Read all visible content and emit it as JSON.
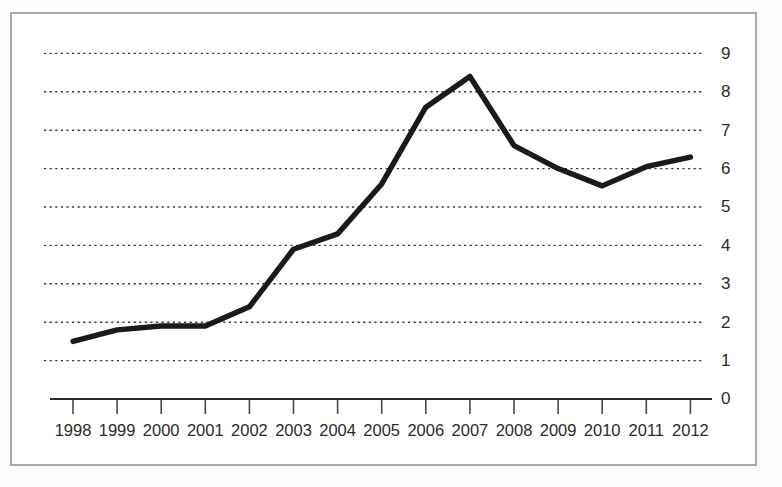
{
  "figure": {
    "frame_border_color": "#a9a9a9",
    "background_color": "#ffffff",
    "line_color": "#1a1a1a",
    "gridline_color": "#3a3a3a",
    "axis_color": "#2a2a2a",
    "tick_label_color": "#2b2b2b"
  },
  "chart_data": {
    "type": "line",
    "title": "",
    "subtitle": "",
    "xlabel": "",
    "ylabel": "",
    "categories": [
      "1998",
      "1999",
      "2000",
      "2001",
      "2002",
      "2003",
      "2004",
      "2005",
      "2006",
      "2007",
      "2008",
      "2009",
      "2010",
      "2011",
      "2012"
    ],
    "values": [
      1.5,
      1.8,
      1.9,
      1.9,
      2.4,
      3.9,
      4.3,
      5.6,
      7.6,
      8.4,
      6.6,
      6.0,
      5.55,
      6.05,
      6.3
    ],
    "series": [
      {
        "name": "",
        "values": [
          1.5,
          1.8,
          1.9,
          1.9,
          2.4,
          3.9,
          4.3,
          5.6,
          7.6,
          8.4,
          6.6,
          6.0,
          5.55,
          6.05,
          6.3
        ]
      }
    ],
    "ylim": [
      0,
      9
    ],
    "xlim": [
      "1998",
      "2012"
    ],
    "ytick_labels": [
      "0",
      "1",
      "2",
      "3",
      "4",
      "5",
      "6",
      "7",
      "8",
      "9"
    ],
    "ytick_values": [
      0,
      1,
      2,
      3,
      4,
      5,
      6,
      7,
      8,
      9
    ],
    "xtick_labels": [
      "1998",
      "1999",
      "2000",
      "2001",
      "2002",
      "2003",
      "2004",
      "2005",
      "2006",
      "2007",
      "2008",
      "2009",
      "2010",
      "2011",
      "2012"
    ],
    "grid": true,
    "grid_style": "dotted-horizontal",
    "y_axis_position": "right",
    "legend": false,
    "legend_position": "none",
    "annotations": []
  }
}
